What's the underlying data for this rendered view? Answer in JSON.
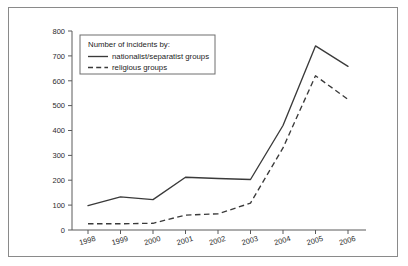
{
  "chart_data": {
    "type": "line",
    "title": "",
    "xlabel": "",
    "ylabel": "",
    "categories": [
      "1998",
      "1999",
      "2000",
      "2001",
      "2002",
      "2003",
      "2004",
      "2005",
      "2006"
    ],
    "ylim": [
      0,
      800
    ],
    "yticks": [
      0,
      100,
      200,
      300,
      400,
      500,
      600,
      700,
      800
    ],
    "grid": false,
    "legend_position": "top-left-inside",
    "legend_title": "Number of incidents by:",
    "series": [
      {
        "name": "nationalist/separatist groups",
        "style": "solid",
        "values": [
          98,
          133,
          122,
          212,
          207,
          203,
          420,
          740,
          658
        ]
      },
      {
        "name": "religious groups",
        "style": "dashed",
        "values": [
          25,
          25,
          27,
          60,
          65,
          108,
          330,
          620,
          525
        ]
      }
    ]
  },
  "axis": {
    "ytick_labels": [
      "0",
      "100",
      "200",
      "300",
      "400",
      "500",
      "600",
      "700",
      "800"
    ],
    "xtick_labels": [
      "1998",
      "1999",
      "2000",
      "2001",
      "2002",
      "2003",
      "2004",
      "2005",
      "2006"
    ]
  },
  "legend": {
    "title": "Number of incidents by:",
    "entries": [
      {
        "label": "nationalist/separatist groups",
        "style": "solid"
      },
      {
        "label": "religious groups",
        "style": "dashed"
      }
    ]
  },
  "colors": {
    "line": "#3a3a3a",
    "axis": "#5a5a5a",
    "frame": "#8a8a8a",
    "text": "#2b2b2b",
    "background": "#ffffff"
  }
}
